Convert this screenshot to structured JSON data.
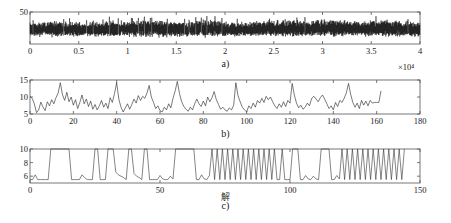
{
  "figure": {
    "background": "#ffffff",
    "line_color": "#000000",
    "axis_color": "#555555"
  },
  "captions": {
    "a": "a)",
    "b": "b)",
    "c": "c)"
  },
  "annotations": {
    "x_multiplier_a": "×10⁴",
    "c_axis_note": "解"
  },
  "chart_data": [
    {
      "type": "line",
      "panel": "a",
      "title": "",
      "xlabel": "",
      "ylabel": "",
      "xlim": [
        0,
        40000
      ],
      "ylim": [
        0,
        50
      ],
      "grid": false,
      "legend": "none",
      "x_multiplier": "×10⁴",
      "xticks": [
        0,
        0.5,
        1,
        1.5,
        2,
        2.5,
        3,
        3.5,
        4
      ],
      "xtick_labels": [
        "0",
        "0.5",
        "1",
        "1.5",
        "2",
        "2.5",
        "3",
        "3.5",
        "4"
      ],
      "yticks": [
        50
      ],
      "ytick_labels": [
        "50"
      ],
      "description": "Dense high-frequency noise band oscillating about a mean near 22, amplitude roughly 8 to 40",
      "x": [
        0,
        2000,
        4000,
        6000,
        8000,
        10000,
        12000,
        14000,
        16000,
        18000,
        20000,
        22000,
        24000,
        26000,
        28000,
        30000,
        32000,
        34000,
        36000,
        38000,
        40000
      ],
      "values": [
        22,
        23,
        22,
        21,
        23,
        22,
        24,
        23,
        22,
        24,
        23,
        22,
        23,
        24,
        23,
        25,
        24,
        23,
        24,
        23,
        22
      ],
      "band_low": [
        10,
        9,
        10,
        11,
        9,
        10,
        8,
        9,
        10,
        9,
        10,
        11,
        10,
        9,
        10,
        9,
        10,
        11,
        10,
        9,
        10
      ],
      "band_high": [
        36,
        38,
        37,
        35,
        39,
        37,
        40,
        38,
        37,
        41,
        38,
        36,
        39,
        40,
        38,
        42,
        40,
        38,
        41,
        39,
        37
      ]
    },
    {
      "type": "line",
      "panel": "b",
      "title": "",
      "xlabel": "",
      "ylabel": "",
      "xlim": [
        0,
        180
      ],
      "ylim": [
        5,
        15
      ],
      "grid": false,
      "legend": "none",
      "xticks": [
        0,
        20,
        40,
        60,
        80,
        100,
        120,
        140,
        160,
        180
      ],
      "xtick_labels": [
        "0",
        "20",
        "40",
        "60",
        "80",
        "100",
        "120",
        "140",
        "160",
        "180"
      ],
      "yticks": [
        5,
        10,
        15
      ],
      "ytick_labels": [
        "5",
        "10",
        "15"
      ],
      "data_end_x": 162,
      "description": "Spiky irregular series fluctuating between about 5 and 14.5, ending near x = 162",
      "x": [
        0,
        1,
        2,
        3,
        4,
        5,
        6,
        7,
        8,
        9,
        10,
        11,
        12,
        13,
        14,
        15,
        16,
        17,
        18,
        19,
        20,
        21,
        22,
        23,
        24,
        25,
        26,
        27,
        28,
        29,
        30,
        31,
        32,
        33,
        34,
        35,
        36,
        37,
        38,
        39,
        40,
        41,
        42,
        43,
        44,
        45,
        46,
        47,
        48,
        49,
        50,
        51,
        52,
        53,
        54,
        55,
        56,
        57,
        58,
        59,
        60,
        61,
        62,
        63,
        64,
        65,
        66,
        67,
        68,
        69,
        70,
        71,
        72,
        73,
        74,
        75,
        76,
        77,
        78,
        79,
        80,
        81,
        82,
        83,
        84,
        85,
        86,
        87,
        88,
        89,
        90,
        91,
        92,
        93,
        94,
        95,
        96,
        97,
        98,
        99,
        100,
        101,
        102,
        103,
        104,
        105,
        106,
        107,
        108,
        109,
        110,
        111,
        112,
        113,
        114,
        115,
        116,
        117,
        118,
        119,
        120,
        121,
        122,
        123,
        124,
        125,
        126,
        127,
        128,
        129,
        130,
        131,
        132,
        133,
        134,
        135,
        136,
        137,
        138,
        139,
        140,
        141,
        142,
        143,
        144,
        145,
        146,
        147,
        148,
        149,
        150,
        151,
        152,
        153,
        154,
        155,
        156,
        157,
        158,
        159,
        160,
        161,
        162
      ],
      "values": [
        10.2,
        9.6,
        8.0,
        5.4,
        6.2,
        8.5,
        7.0,
        6.0,
        8.6,
        7.4,
        9.2,
        8.0,
        9.8,
        11.2,
        14.2,
        10.6,
        9.0,
        11.4,
        8.6,
        10.0,
        7.6,
        9.2,
        6.6,
        8.4,
        10.6,
        8.0,
        9.4,
        7.2,
        8.8,
        6.4,
        7.8,
        6.2,
        7.4,
        9.0,
        7.0,
        8.2,
        6.6,
        9.8,
        8.4,
        11.0,
        14.2,
        9.4,
        7.0,
        5.6,
        6.8,
        8.0,
        6.4,
        7.8,
        9.4,
        8.2,
        10.4,
        9.0,
        10.2,
        9.6,
        11.2,
        13.4,
        10.0,
        8.4,
        6.6,
        7.4,
        6.0,
        5.6,
        7.0,
        6.2,
        8.0,
        6.8,
        9.6,
        11.8,
        14.6,
        11.0,
        8.6,
        7.2,
        6.4,
        5.8,
        7.0,
        6.2,
        8.0,
        9.4,
        8.0,
        7.2,
        8.8,
        7.4,
        10.0,
        8.6,
        9.8,
        11.6,
        9.2,
        7.8,
        6.4,
        7.0,
        6.2,
        5.8,
        6.8,
        6.2,
        7.6,
        14.2,
        10.4,
        8.6,
        7.0,
        6.2,
        5.6,
        7.4,
        6.6,
        8.2,
        7.0,
        9.0,
        8.2,
        9.6,
        8.4,
        10.2,
        9.2,
        10.0,
        8.6,
        7.4,
        6.6,
        8.0,
        7.0,
        8.6,
        7.2,
        9.0,
        8.2,
        14.0,
        10.6,
        8.2,
        6.8,
        7.6,
        6.4,
        7.0,
        8.2,
        7.4,
        9.6,
        10.2,
        9.4,
        8.6,
        9.8,
        10.6,
        9.4,
        8.0,
        6.6,
        7.4,
        6.2,
        8.4,
        7.2,
        9.0,
        8.4,
        9.6,
        11.2,
        14.0,
        10.8,
        8.4,
        7.0,
        8.2,
        6.6,
        9.0,
        7.6,
        8.8,
        7.4,
        9.0,
        8.2,
        8.4,
        8.4,
        8.4,
        11.8,
        11.6
      ]
    },
    {
      "type": "line",
      "panel": "c",
      "title": "",
      "xlabel": "",
      "ylabel": "",
      "xlim": [
        0,
        150
      ],
      "ylim": [
        5,
        10
      ],
      "grid": false,
      "legend": "none",
      "xticks": [
        0,
        50,
        100,
        150
      ],
      "xtick_labels": [
        "0",
        "50",
        "100",
        "150"
      ],
      "yticks": [
        6,
        8,
        10
      ],
      "ytick_labels": [
        "6",
        "8",
        "10"
      ],
      "data_end_x": 145,
      "description": "Square-like switching waveform alternating between a low plateau near 5.5 and a clipped high plateau at 10, with increasing switching frequency toward the right",
      "x": [
        0,
        1,
        2,
        3,
        4,
        5,
        6,
        7,
        8,
        9,
        10,
        11,
        12,
        13,
        14,
        15,
        16,
        17,
        18,
        19,
        20,
        21,
        22,
        23,
        24,
        25,
        26,
        27,
        28,
        29,
        30,
        31,
        32,
        33,
        34,
        35,
        36,
        37,
        38,
        39,
        40,
        41,
        42,
        43,
        44,
        45,
        46,
        47,
        48,
        49,
        50,
        51,
        52,
        53,
        54,
        55,
        56,
        57,
        58,
        59,
        60,
        61,
        62,
        63,
        64,
        65,
        66,
        67,
        68,
        69,
        70,
        71,
        72,
        73,
        74,
        75,
        76,
        77,
        78,
        79,
        80,
        81,
        82,
        83,
        84,
        85,
        86,
        87,
        88,
        89,
        90,
        91,
        92,
        93,
        94,
        95,
        96,
        97,
        98,
        99,
        100,
        101,
        102,
        103,
        104,
        105,
        106,
        107,
        108,
        109,
        110,
        111,
        112,
        113,
        114,
        115,
        116,
        117,
        118,
        119,
        120,
        121,
        122,
        123,
        124,
        125,
        126,
        127,
        128,
        129,
        130,
        131,
        132,
        133,
        134,
        135,
        136,
        137,
        138,
        139,
        140,
        141,
        142,
        143,
        144,
        145
      ],
      "values": [
        5.5,
        5.5,
        6.2,
        5.5,
        5.5,
        5.5,
        5.5,
        5.5,
        10,
        10,
        10,
        10,
        10,
        10,
        10,
        10,
        5.5,
        5.5,
        5.5,
        5.5,
        6.2,
        5.8,
        5.5,
        5.5,
        5.5,
        10,
        10,
        5.5,
        5.5,
        5.5,
        10,
        10,
        10,
        6.6,
        6.2,
        6.0,
        5.8,
        5.5,
        10,
        10,
        6.4,
        6.0,
        5.8,
        5.5,
        10,
        10,
        5.5,
        5.5,
        5.5,
        5.5,
        6.1,
        5.6,
        5.5,
        5.5,
        6.0,
        5.6,
        10,
        10,
        10,
        10,
        10,
        10,
        10,
        10,
        5.5,
        5.5,
        6.2,
        5.6,
        5.5,
        6.1,
        10,
        5.5,
        10,
        5.5,
        10,
        5.5,
        10,
        5.5,
        10,
        5.5,
        10,
        5.5,
        10,
        5.5,
        10,
        5.5,
        10,
        5.5,
        10,
        5.5,
        10,
        5.5,
        10,
        5.5,
        10,
        5.5,
        5.5,
        10,
        5.5,
        5.5,
        5.5,
        10,
        10,
        10,
        5.5,
        5.5,
        6.1,
        5.6,
        5.5,
        6.0,
        5.6,
        5.5,
        10,
        10,
        10,
        10,
        5.5,
        5.5,
        6.1,
        5.6,
        10,
        5.5,
        10,
        5.5,
        10,
        5.5,
        10,
        5.5,
        10,
        5.5,
        10,
        5.5,
        10,
        5.5,
        10,
        5.5,
        10,
        5.5,
        10,
        5.5,
        10,
        5.5,
        10,
        5.5,
        10
      ]
    }
  ]
}
